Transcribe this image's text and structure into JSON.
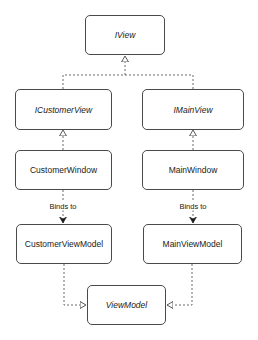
{
  "diagram": {
    "type": "class-diagram",
    "nodes": [
      {
        "id": "iview",
        "label": "IView",
        "kind": "interface"
      },
      {
        "id": "icustomerview",
        "label": "ICustomerView",
        "kind": "interface"
      },
      {
        "id": "imainview",
        "label": "IMainView",
        "kind": "interface"
      },
      {
        "id": "customerwindow",
        "label": "CustomerWindow",
        "kind": "class"
      },
      {
        "id": "mainwindow",
        "label": "MainWindow",
        "kind": "class"
      },
      {
        "id": "customerviewmodel",
        "label": "CustomerViewModel",
        "kind": "class"
      },
      {
        "id": "mainviewmodel",
        "label": "MainViewModel",
        "kind": "class"
      },
      {
        "id": "viewmodel",
        "label": "ViewModel",
        "kind": "abstract"
      }
    ],
    "edges": [
      {
        "from": "icustomerview",
        "to": "iview",
        "style": "dashed",
        "arrow": "hollow-triangle",
        "label": ""
      },
      {
        "from": "imainview",
        "to": "iview",
        "style": "dashed",
        "arrow": "hollow-triangle",
        "label": ""
      },
      {
        "from": "customerwindow",
        "to": "icustomerview",
        "style": "dashed",
        "arrow": "hollow-triangle",
        "label": ""
      },
      {
        "from": "mainwindow",
        "to": "imainview",
        "style": "dashed",
        "arrow": "hollow-triangle",
        "label": ""
      },
      {
        "from": "customerwindow",
        "to": "customerviewmodel",
        "style": "dashed",
        "arrow": "filled-open",
        "label": "Binds to"
      },
      {
        "from": "mainwindow",
        "to": "mainviewmodel",
        "style": "dashed",
        "arrow": "filled-open",
        "label": "Binds to"
      },
      {
        "from": "customerviewmodel",
        "to": "viewmodel",
        "style": "dashed",
        "arrow": "hollow-triangle",
        "label": ""
      },
      {
        "from": "mainviewmodel",
        "to": "viewmodel",
        "style": "dashed",
        "arrow": "hollow-triangle",
        "label": ""
      }
    ],
    "labels": {
      "binds_to_left": "Binds to",
      "binds_to_right": "Binds to"
    },
    "colors": {
      "stroke": "#4a4a4a",
      "text": "#1a1a1a",
      "background": "#ffffff"
    }
  }
}
